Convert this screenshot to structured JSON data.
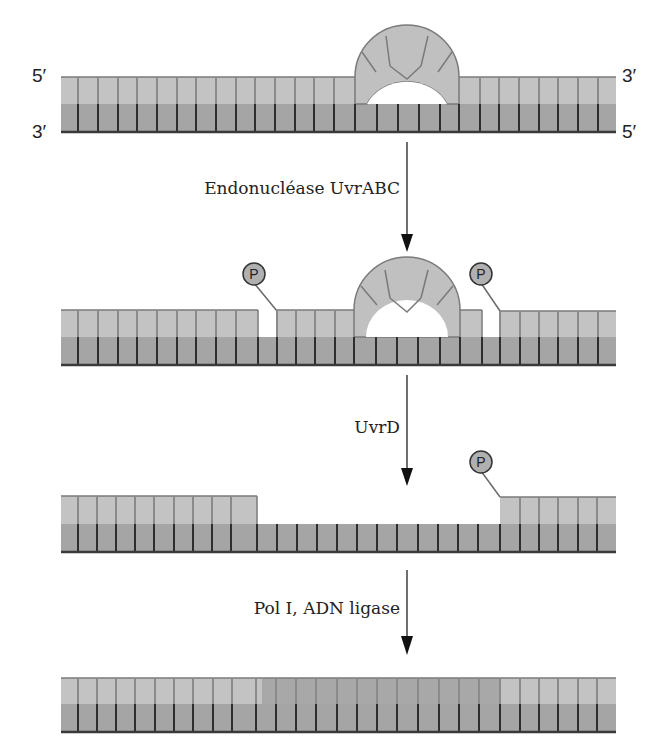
{
  "figure": {
    "colors": {
      "top_strand": "#c3c3c3",
      "bottom_strand": "#a5a5a5",
      "repaired_fill": "#a8a8a8",
      "tick_top": "#8a8a8a",
      "tick_bottom": "#2e2e2e",
      "backbone": "#5a5a5a",
      "phosphate_fill": "#b0b0b0",
      "background": "#ffffff"
    },
    "strand_labels": {
      "top_left": "5′",
      "top_right": "3′",
      "bottom_left": "3′",
      "bottom_right": "5′"
    },
    "phosphate_label": "P",
    "steps": [
      {
        "id": "damaged",
        "description": "ADN endommagé (dimère de pyrimidine)"
      },
      {
        "id": "incised",
        "enzyme": "Endonucléase UvrABC",
        "description": "Incisions de part et d'autre de la lésion"
      },
      {
        "id": "excised",
        "enzyme": "UvrD",
        "description": "Oligonucléotide excisé, brèche"
      },
      {
        "id": "repaired",
        "enzyme": "Pol I, ADN ligase",
        "description": "Brèche comblée et scellée"
      }
    ]
  }
}
